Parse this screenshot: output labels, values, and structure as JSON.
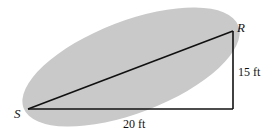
{
  "diagram": {
    "vertices": {
      "S": {
        "label": "S",
        "x": 28,
        "y": 109
      },
      "R": {
        "label": "R",
        "x": 233,
        "y": 31
      },
      "corner": {
        "x": 233,
        "y": 109
      }
    },
    "edges": {
      "base_length": "20 ft",
      "height_length": "15 ft"
    },
    "ellipse": {
      "cx": 131,
      "cy": 67,
      "rx": 115,
      "ry": 46,
      "rotation_deg": -21,
      "fill": "#c9c9c9"
    },
    "stroke_color": "#111111"
  }
}
